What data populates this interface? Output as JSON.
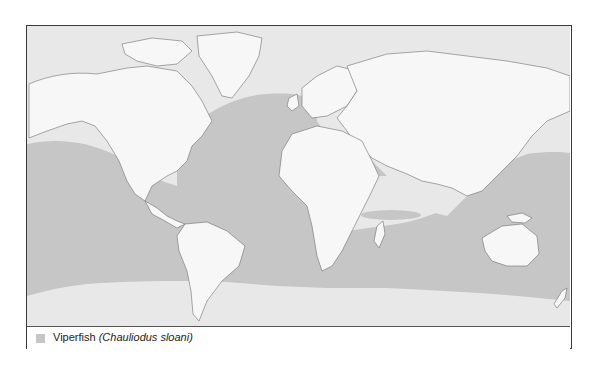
{
  "map": {
    "colors": {
      "ocean": "#e8e8e8",
      "range": "#c6c6c6",
      "land": "#f7f7f7",
      "coast": "#6e6e6e",
      "frame": "#3a3a3a"
    }
  },
  "legend": {
    "items": [
      {
        "swatch_color": "#c6c6c6",
        "common_name": "Viperfish",
        "scientific_name": "(Chauliodus sloani)"
      }
    ]
  }
}
